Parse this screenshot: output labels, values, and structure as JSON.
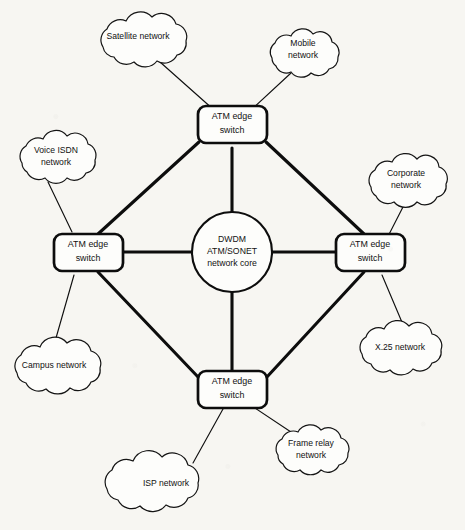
{
  "figure": {
    "type": "network-topology-diagram",
    "background_color": "#f7f6f2",
    "line_color": "#0d0d0d",
    "node_fill": "#fdfdfb",
    "caption_clipped": true,
    "caption_text": ""
  },
  "core": {
    "shape": "circle",
    "lines": [
      "DWDM",
      "ATM/SONET",
      "network core"
    ],
    "line1": "DWDM",
    "line2": "ATM/SONET",
    "line3": "network core"
  },
  "switches": [
    {
      "id": "switch-north",
      "position": "top",
      "line1": "ATM edge",
      "line2": "switch"
    },
    {
      "id": "switch-west",
      "position": "left",
      "line1": "ATM edge",
      "line2": "switch"
    },
    {
      "id": "switch-east",
      "position": "right",
      "line1": "ATM edge",
      "line2": "switch"
    },
    {
      "id": "switch-south",
      "position": "bottom",
      "line1": "ATM edge",
      "line2": "switch"
    }
  ],
  "clouds": [
    {
      "id": "cloud-satellite",
      "line1": "Satellite network",
      "line2": "",
      "attaches_to": "switch-north"
    },
    {
      "id": "cloud-mobile",
      "line1": "Mobile",
      "line2": "network",
      "attaches_to": "switch-north"
    },
    {
      "id": "cloud-voice-isdn",
      "line1": "Voice ISDN",
      "line2": "network",
      "attaches_to": "switch-west"
    },
    {
      "id": "cloud-corporate",
      "line1": "Corporate",
      "line2": "network",
      "attaches_to": "switch-east"
    },
    {
      "id": "cloud-campus",
      "line1": "Campus network",
      "line2": "",
      "attaches_to": "switch-west"
    },
    {
      "id": "cloud-x25",
      "line1": "X.25 network",
      "line2": "",
      "attaches_to": "switch-east"
    },
    {
      "id": "cloud-frame-relay",
      "line1": "Frame relay",
      "line2": "network",
      "attaches_to": "switch-south"
    },
    {
      "id": "cloud-isp",
      "line1": "ISP network",
      "line2": "",
      "attaches_to": "switch-south"
    }
  ],
  "links": {
    "core_spokes": [
      "core-to-switch-north",
      "core-to-switch-west",
      "core-to-switch-east",
      "core-to-switch-south"
    ],
    "ring": [
      "switch-north-to-switch-west",
      "switch-north-to-switch-east",
      "switch-west-to-switch-south",
      "switch-east-to-switch-south"
    ]
  }
}
